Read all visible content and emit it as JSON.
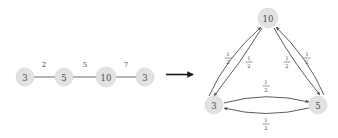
{
  "figure": {
    "title": "",
    "background_color": "#ffffff",
    "node_fill": "#e2e2e2",
    "node_text_color": "#4d4d4d",
    "edge_color": "#5a5a5a"
  },
  "transform_arrow": {
    "icon": "right-arrow-icon",
    "label": ""
  },
  "left_graph": {
    "name": "path-graph",
    "directed": false,
    "nodes": [
      {
        "id": "L0",
        "label": "3",
        "x": 25,
        "y": 77
      },
      {
        "id": "L1",
        "label": "5",
        "x": 64,
        "y": 77
      },
      {
        "id": "L2",
        "label": "10",
        "x": 106,
        "y": 77
      },
      {
        "id": "L3",
        "label": "3",
        "x": 145,
        "y": 77
      }
    ],
    "edges": [
      {
        "from": "L0",
        "to": "L1",
        "label": "2",
        "lx": 44,
        "ly": 65
      },
      {
        "from": "L1",
        "to": "L2",
        "label": "5",
        "lx": 85,
        "ly": 65
      },
      {
        "from": "L2",
        "to": "L3",
        "label": "7",
        "lx": 126,
        "ly": 65
      }
    ]
  },
  "right_graph": {
    "name": "triangle-digraph",
    "directed": true,
    "nodes": [
      {
        "id": "R10",
        "label": "10",
        "x": 268,
        "y": 18
      },
      {
        "id": "R3",
        "label": "3",
        "x": 214,
        "y": 105
      },
      {
        "id": "R5",
        "label": "5",
        "x": 318,
        "y": 105
      }
    ],
    "edges": [
      {
        "from": "R3",
        "to": "R10",
        "numerator": "1",
        "denominator": "2",
        "lx": 228,
        "ly": 58
      },
      {
        "from": "R10",
        "to": "R3",
        "numerator": "1",
        "denominator": "2",
        "lx": 249,
        "ly": 62
      },
      {
        "from": "R10",
        "to": "R5",
        "numerator": "1",
        "denominator": "2",
        "lx": 287,
        "ly": 62
      },
      {
        "from": "R5",
        "to": "R10",
        "numerator": "1",
        "denominator": "2",
        "lx": 307,
        "ly": 58
      },
      {
        "from": "R3",
        "to": "R5",
        "numerator": "1",
        "denominator": "2",
        "lx": 266,
        "ly": 86
      },
      {
        "from": "R5",
        "to": "R3",
        "numerator": "1",
        "denominator": "2",
        "lx": 266,
        "ly": 124
      }
    ]
  }
}
